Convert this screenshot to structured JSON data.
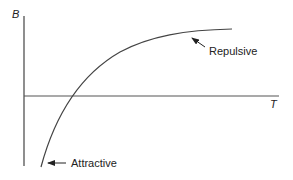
{
  "diagram": {
    "type": "line-sketch",
    "axes": {
      "y_label": "B",
      "x_label": "T"
    },
    "curve": {
      "description": "Concave-down increasing curve starting below T-axis, crossing it, and leveling off above",
      "color": "#444444"
    },
    "annotations": [
      {
        "id": "repulsive",
        "label": "Repulsive",
        "points_to": "upper plateau of curve"
      },
      {
        "id": "attractive",
        "label": "Attractive",
        "points_to": "lower start of curve"
      }
    ]
  },
  "colors": {
    "line": "#444444",
    "text": "#222222",
    "background": "#ffffff"
  }
}
